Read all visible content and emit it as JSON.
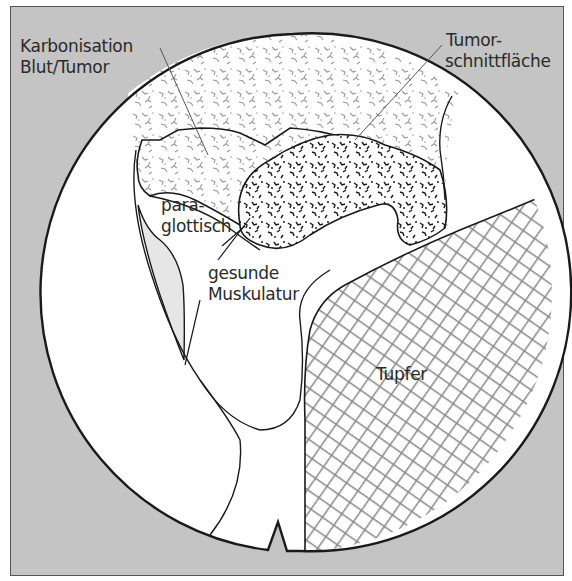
{
  "diagram": {
    "type": "endoscopic anatomical illustration",
    "colors": {
      "background": "#c4c4c4",
      "outline": "#1a1a1a",
      "field": "#ffffff",
      "shaded_region": "#e4e4e4",
      "hatch": "#8a8a8a",
      "tumor_texture": "#1a1a1a",
      "carbonization_texture": "#8c8c8c"
    },
    "labels": {
      "karbonisation_line1": "Karbonisation",
      "karbonisation_line2": "Blut/Tumor",
      "tumor_line1": "Tumor-",
      "tumor_line2": "schnittfläche",
      "para_line1": "para-",
      "para_line2": "glottisch",
      "muskulatur_line1": "gesunde",
      "muskulatur_line2": "Muskulatur",
      "tupfer": "Tupfer"
    }
  }
}
